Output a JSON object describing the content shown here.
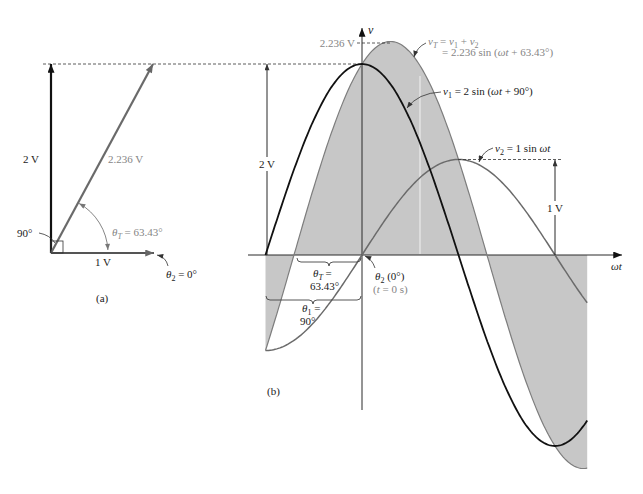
{
  "panel_a": {
    "caption": "(a)",
    "phasors": [
      {
        "name": "v1",
        "magnitude": 2,
        "angle_deg": 90,
        "magnitude_label": "2 V",
        "color": "#111111"
      },
      {
        "name": "v2",
        "magnitude": 1,
        "angle_deg": 0,
        "magnitude_label": "1 V",
        "color": "#555555"
      },
      {
        "name": "vT",
        "magnitude": 2.236,
        "angle_deg": 63.43,
        "magnitude_label": "2.236 V",
        "color": "#6a6a6a"
      }
    ],
    "right_angle_label": "90°",
    "theta_T": {
      "text": "θT = 63.43°",
      "segments": [
        {
          "t": "θ",
          "i": 1
        },
        {
          "t": "T",
          "i": 1,
          "s": 1
        },
        {
          "t": " = 63.43°"
        }
      ]
    },
    "theta_2": {
      "text": "θ2 = 0°",
      "segments": [
        {
          "t": "θ",
          "i": 1
        },
        {
          "t": "2",
          "s": 1
        },
        {
          "t": " = 0°"
        }
      ]
    }
  },
  "panel_b": {
    "caption": "(b)",
    "axis_labels": {
      "vertical": "v",
      "horizontal": "ωt"
    },
    "peak_label_vT": "2.236 V",
    "dimension_v1": "2 V",
    "dimension_v2": "1 V",
    "vT_formula": {
      "text": "vT = v1 + v2 = 2.236 sin (ωt + 63.43°)",
      "line1": [
        {
          "t": "v",
          "i": 1
        },
        {
          "t": "T",
          "i": 1,
          "s": 1
        },
        {
          "t": " = "
        },
        {
          "t": "v",
          "i": 1
        },
        {
          "t": "1",
          "s": 1
        },
        {
          "t": " + "
        },
        {
          "t": "v",
          "i": 1
        },
        {
          "t": "2",
          "s": 1
        }
      ],
      "line2": [
        {
          "t": "= 2.236 sin ("
        },
        {
          "t": "ωt",
          "i": 1
        },
        {
          "t": " + 63.43°)"
        }
      ]
    },
    "v1_formula": {
      "text": "v1 = 2 sin (ωt + 90°)",
      "segments": [
        {
          "t": "v",
          "i": 1
        },
        {
          "t": "1",
          "s": 1
        },
        {
          "t": " = 2 sin ("
        },
        {
          "t": "ωt",
          "i": 1
        },
        {
          "t": " + 90°)"
        }
      ]
    },
    "v2_formula": {
      "text": "v2 = 1 sin ωt",
      "segments": [
        {
          "t": "v",
          "i": 1
        },
        {
          "t": "2",
          "s": 1
        },
        {
          "t": " = 1 sin "
        },
        {
          "t": "ωt",
          "i": 1
        }
      ]
    },
    "theta_T": {
      "text": "θT = 63.43°",
      "line1": [
        {
          "t": "θ",
          "i": 1
        },
        {
          "t": "T",
          "i": 1,
          "s": 1
        },
        {
          "t": " ="
        }
      ],
      "line2": "63.43°"
    },
    "theta_1": {
      "text": "θ1 = 90°",
      "line1": [
        {
          "t": "θ",
          "i": 1
        },
        {
          "t": "1",
          "s": 1
        },
        {
          "t": " ="
        }
      ],
      "line2": "90°"
    },
    "theta_2": {
      "text": "θ2 (0°) (t = 0 s)",
      "line1": [
        {
          "t": "θ",
          "i": 1
        },
        {
          "t": "2",
          "s": 1
        },
        {
          "t": " (0°)"
        }
      ],
      "line2": [
        {
          "t": "("
        },
        {
          "t": "t",
          "i": 1
        },
        {
          "t": " = 0 s)"
        }
      ]
    },
    "shading_color": "#c7c7c7",
    "waveforms": [
      {
        "name": "v1",
        "amplitude": 2,
        "phase_deg": 90,
        "color": "#111111"
      },
      {
        "name": "v2",
        "amplitude": 1,
        "phase_deg": 0,
        "color": "#6b6b6b"
      },
      {
        "name": "vT",
        "amplitude": 2.236,
        "phase_deg": 63.43,
        "color": "#7d7d7d"
      }
    ]
  }
}
